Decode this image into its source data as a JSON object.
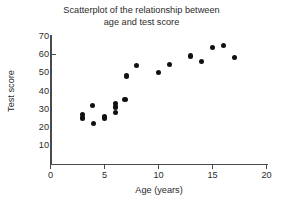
{
  "chart_data": {
    "type": "scatter",
    "title": "Scatterplot of the relationship between\nage and test score",
    "xlabel": "Age (years)",
    "ylabel": "Test score",
    "xlim": [
      0,
      20
    ],
    "ylim": [
      0,
      70
    ],
    "xticks": [
      0,
      5,
      10,
      15,
      20
    ],
    "yticks": [
      10,
      20,
      30,
      40,
      50,
      60,
      70
    ],
    "xtick_labels": [
      "0",
      "5",
      "10",
      "15",
      "20"
    ],
    "ytick_labels": [
      "10",
      "20",
      "30",
      "40",
      "50",
      "60",
      "70"
    ],
    "grid": false,
    "legend": null,
    "series": [
      {
        "name": "Age vs test score",
        "marker": "circle",
        "color": "#111111",
        "points": [
          {
            "x": 3.0,
            "y": 27
          },
          {
            "x": 3.0,
            "y": 25
          },
          {
            "x": 3.9,
            "y": 32
          },
          {
            "x": 4.0,
            "y": 22
          },
          {
            "x": 5.0,
            "y": 26
          },
          {
            "x": 5.0,
            "y": 25
          },
          {
            "x": 6.0,
            "y": 33
          },
          {
            "x": 6.0,
            "y": 31
          },
          {
            "x": 6.0,
            "y": 28
          },
          {
            "x": 6.9,
            "y": 35
          },
          {
            "x": 7.0,
            "y": 48
          },
          {
            "x": 8.0,
            "y": 54
          },
          {
            "x": 10.0,
            "y": 50
          },
          {
            "x": 11.0,
            "y": 54.5
          },
          {
            "x": 13.0,
            "y": 59
          },
          {
            "x": 14.0,
            "y": 56
          },
          {
            "x": 15.0,
            "y": 63.5
          },
          {
            "x": 16.0,
            "y": 65
          },
          {
            "x": 17.0,
            "y": 58
          }
        ]
      }
    ]
  },
  "colors": {
    "axis": "#4a4a4a",
    "marker": "#111111",
    "text": "#2b2b2b",
    "background": "#ffffff"
  }
}
